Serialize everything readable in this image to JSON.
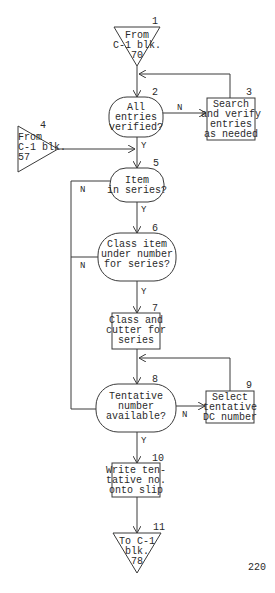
{
  "flowchart": {
    "nodes": {
      "n1": {
        "number": "1",
        "type": "off-page-connector",
        "lines": [
          "From",
          "C-1 blk.",
          "70"
        ]
      },
      "n2": {
        "number": "2",
        "type": "decision",
        "lines": [
          "All",
          "entries",
          "verified?"
        ]
      },
      "n3": {
        "number": "3",
        "type": "process",
        "lines": [
          "Search",
          "and verify",
          "entries",
          "as needed"
        ]
      },
      "n4": {
        "number": "4",
        "type": "off-page-connector",
        "lines": [
          "From",
          "C-1 blk.",
          "57"
        ]
      },
      "n5": {
        "number": "5",
        "type": "decision",
        "lines": [
          "Item",
          "in series?"
        ]
      },
      "n6": {
        "number": "6",
        "type": "decision",
        "lines": [
          "Class item",
          "under number",
          "for series?"
        ]
      },
      "n7": {
        "number": "7",
        "type": "process",
        "lines": [
          "Class and",
          "cutter for",
          "series"
        ]
      },
      "n8": {
        "number": "8",
        "type": "decision",
        "lines": [
          "Tentative",
          "number",
          "available?"
        ]
      },
      "n9": {
        "number": "9",
        "type": "process",
        "lines": [
          "Select",
          "tentative",
          "DC number"
        ]
      },
      "n10": {
        "number": "10",
        "type": "process",
        "lines": [
          "Write ten-",
          "tative no.",
          "onto slip"
        ]
      },
      "n11": {
        "number": "11",
        "type": "off-page-connector",
        "lines": [
          "To C-1",
          "blk.",
          "78"
        ]
      }
    },
    "edge_labels": {
      "n2_no": "N",
      "n2_yes": "Y",
      "n5_no": "N",
      "n5_yes": "Y",
      "n6_no": "N",
      "n6_yes": "Y",
      "n8_no": "N",
      "n8_yes": "Y"
    }
  },
  "page_number": "220"
}
